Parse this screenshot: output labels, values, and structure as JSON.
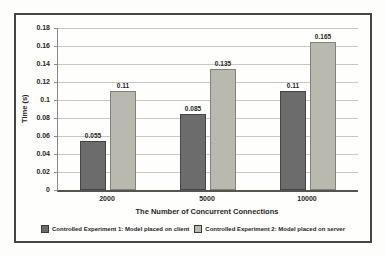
{
  "chart_data": {
    "type": "bar",
    "title": "",
    "categories": [
      "2000",
      "5000",
      "10000"
    ],
    "series": [
      {
        "name": "Controlled Experiment 1: Model placed on client",
        "values": [
          0.055,
          0.085,
          0.11
        ],
        "labels": [
          "0.055",
          "0.085",
          "0.11"
        ],
        "color": "#6c6c6c",
        "border_color": "#454545"
      },
      {
        "name": "Controlled Experiment 2: Model placed on server",
        "values": [
          0.11,
          0.135,
          0.165
        ],
        "labels": [
          "0.11",
          "0.135",
          "0.165"
        ],
        "color": "#b9b9b0",
        "border_color": "#82827a"
      }
    ],
    "xlabel": "The Number of Concurrent Connections",
    "ylabel": "Time (s)",
    "ylim": [
      0,
      0.18
    ],
    "ytick_labels": [
      "0",
      "0.02",
      "0.04",
      "0.06",
      "0.08",
      "0.1",
      "0.12",
      "0.14",
      "0.16",
      "0.18"
    ],
    "grid": true,
    "legend_position": "bottom",
    "data_labels": true
  },
  "colors": {
    "frame_border": "#454540",
    "grid_line": "#c8c8c2",
    "axis_line": "#8a8a84",
    "baseline": "#55554f",
    "text": "#262626",
    "background": "#fdfdfb",
    "series1_fill": "#6c6c6c",
    "series2_fill": "#b9b9b0"
  }
}
